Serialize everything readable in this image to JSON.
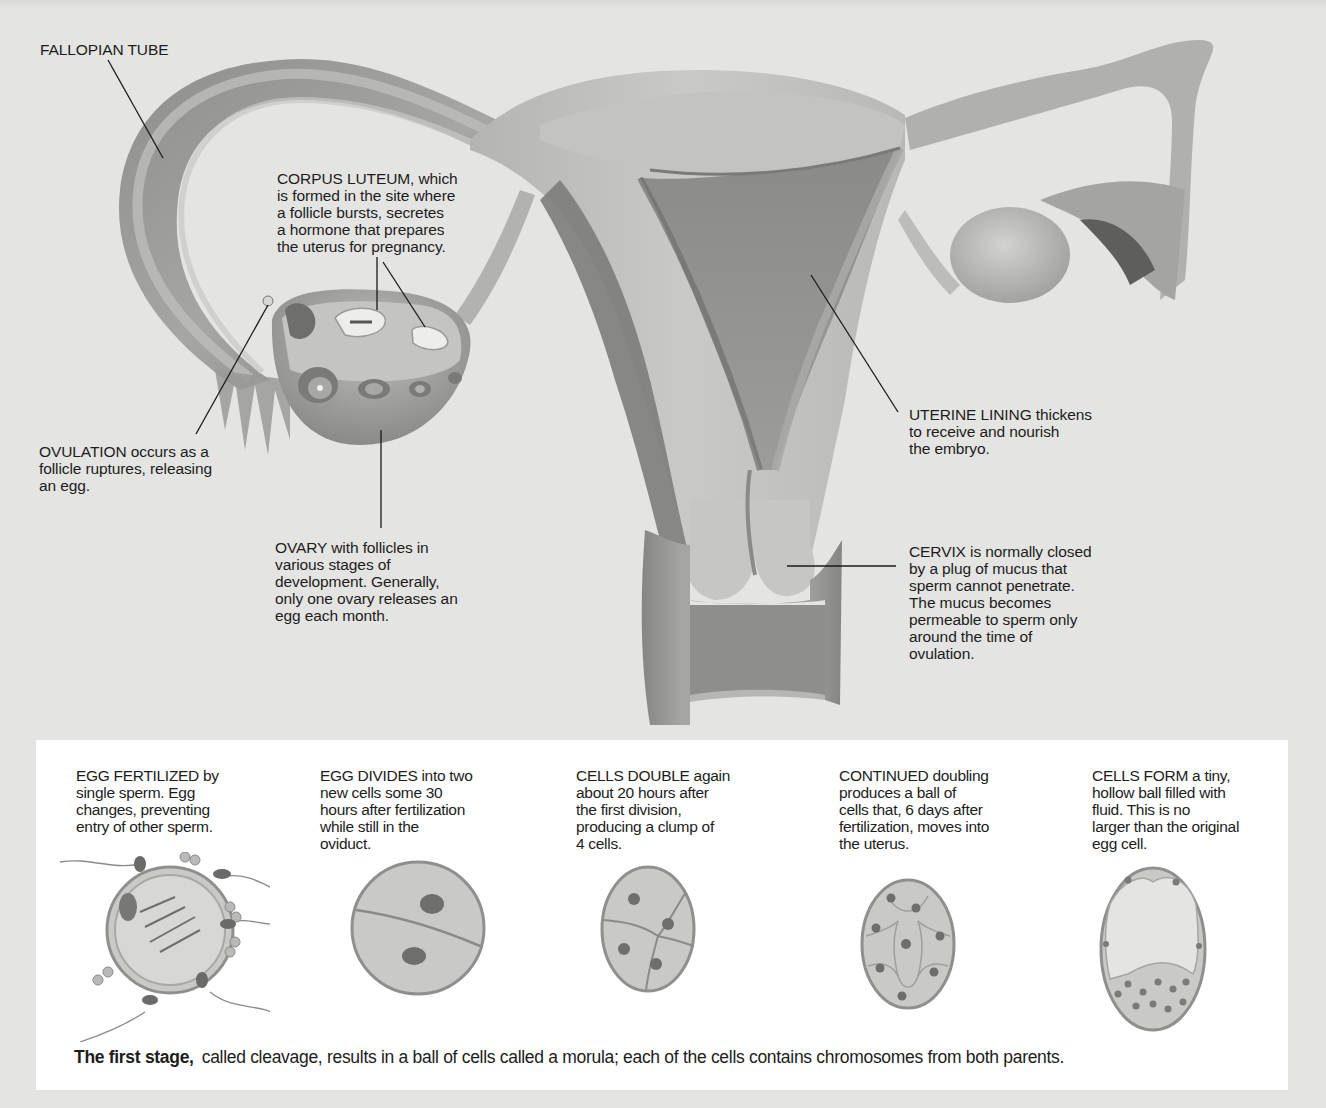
{
  "figure": {
    "colors": {
      "background": "#e4e4e2",
      "panel": "#ffffff",
      "tissue_light": "#c8c8c6",
      "tissue_mid": "#9a9a98",
      "tissue_dark": "#6e6e6c",
      "ink": "#1c1c1c"
    }
  },
  "labels": {
    "fallopian_tube": "FALLOPIAN TUBE",
    "corpus_luteum": [
      "CORPUS LUTEUM, which",
      "is formed in the site where",
      "a follicle bursts, secretes",
      "a hormone that prepares",
      "the uterus for pregnancy."
    ],
    "ovulation": [
      "OVULATION occurs as a",
      "follicle ruptures, releasing",
      "an egg."
    ],
    "ovary": [
      "OVARY with follicles in",
      "various stages of",
      "development. Generally,",
      "only one ovary releases an",
      "egg each month."
    ],
    "uterine_lining": [
      "UTERINE LINING thickens",
      "to receive and nourish",
      "the embryo."
    ],
    "cervix": [
      "CERVIX is normally closed",
      "by a plug of mucus that",
      "sperm cannot penetrate.",
      "The mucus becomes",
      "permeable to sperm only",
      "around the time of",
      "ovulation."
    ]
  },
  "stages": [
    {
      "icon": "fertilized-egg",
      "lines": [
        "EGG FERTILIZED by",
        "single sperm. Egg",
        "changes, preventing",
        "entry of other sperm."
      ]
    },
    {
      "icon": "two-cell-embryo",
      "lines": [
        "EGG DIVIDES into two",
        "new cells some 30",
        "hours after fertilization",
        "while still in the",
        "oviduct."
      ]
    },
    {
      "icon": "four-cell-embryo",
      "lines": [
        "CELLS DOUBLE again",
        "about 20 hours after",
        "the first division,",
        "producing a clump of",
        "4 cells."
      ]
    },
    {
      "icon": "morula",
      "lines": [
        "CONTINUED doubling",
        "produces a ball of",
        "cells that, 6 days after",
        "fertilization, moves into",
        "the uterus."
      ]
    },
    {
      "icon": "blastocyst",
      "lines": [
        "CELLS FORM a tiny,",
        "hollow ball filled with",
        "fluid. This is no",
        "larger than the original",
        "egg cell."
      ]
    }
  ],
  "caption": {
    "lead": "The first stage,",
    "text": "called cleavage, results in a ball of cells called a morula; each of the cells contains chromosomes from both parents."
  }
}
